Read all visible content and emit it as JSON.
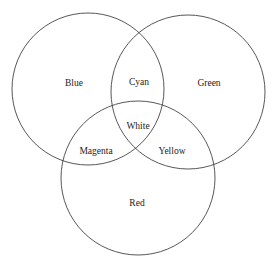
{
  "diagram": {
    "type": "venn",
    "title": "",
    "circles": [
      {
        "id": "blue",
        "label": "Blue",
        "cx": 88,
        "cy": 89,
        "r": 76
      },
      {
        "id": "green",
        "label": "Green",
        "cx": 188,
        "cy": 92,
        "r": 77
      },
      {
        "id": "red",
        "label": "Red",
        "cx": 138,
        "cy": 178,
        "r": 77
      }
    ],
    "regions": {
      "blue": "Blue",
      "green": "Green",
      "red": "Red",
      "blue_green": "Cyan",
      "blue_red": "Magenta",
      "green_red": "Yellow",
      "all": "White"
    },
    "stroke_color": "#444444",
    "background": "#ffffff"
  }
}
